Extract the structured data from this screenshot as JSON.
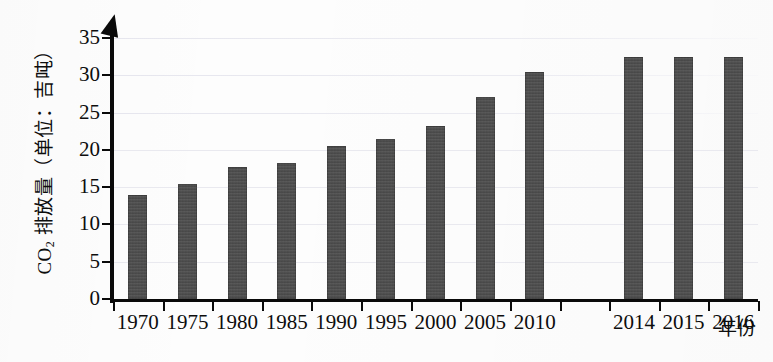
{
  "chart_data": {
    "type": "bar",
    "title": "",
    "xlabel": "年份",
    "ylabel": "CO₂ 排放量（单位：吉吨）",
    "ylabel_parts": {
      "prefix": "CO",
      "subscript": "2",
      "suffix": " 排放量（单位：吉吨）"
    },
    "categories": [
      "1970",
      "1975",
      "1980",
      "1985",
      "1990",
      "1995",
      "2000",
      "2005",
      "2010",
      "",
      "2014",
      "2015",
      "2016"
    ],
    "values": [
      13.9,
      15.4,
      17.7,
      18.2,
      20.5,
      21.4,
      23.2,
      27.1,
      30.5,
      null,
      32.5,
      32.5,
      32.5
    ],
    "ylim": [
      0,
      35
    ],
    "yticks": [
      0,
      5,
      10,
      15,
      20,
      25,
      30,
      35
    ],
    "ytick_labels": [
      "0",
      "5",
      "10",
      "15",
      "20",
      "25",
      "30",
      "35"
    ],
    "grid": true,
    "grid_axis": "y",
    "legend": false,
    "bar_color": "#4b4b4b",
    "axis_color": "#0a0a0a",
    "grid_color": "#e9e9ef",
    "background_color": "#fdfdfd"
  },
  "figure": {
    "y_axis_arrow": "up-arrow-icon",
    "x_axis_name": "年份"
  }
}
